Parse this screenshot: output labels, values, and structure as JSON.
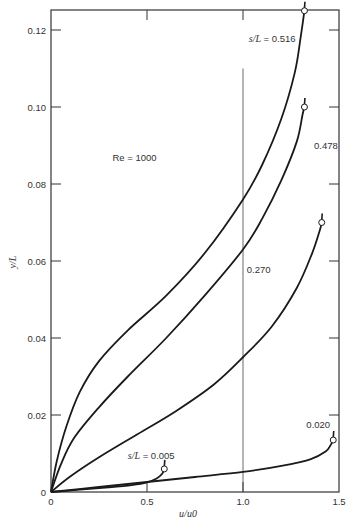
{
  "chart_data": {
    "type": "line",
    "title": "",
    "xlabel": "u/u0",
    "ylabel": "y/L",
    "xlim": [
      0,
      1.5
    ],
    "ylim": [
      0,
      0.125
    ],
    "grid": false,
    "x_ticks": [
      "0",
      "0.5",
      "1.0",
      "1.5"
    ],
    "y_ticks": [
      "0",
      "0.02",
      "0.04",
      "0.06",
      "0.08",
      "0.10",
      "0.12"
    ],
    "reference_line": {
      "x": 1.0,
      "y_from": 0,
      "y_to": 0.11
    },
    "annotations": [
      {
        "text": "Re = 1000",
        "x": 0.32,
        "y": 0.086
      },
      {
        "text": "s/L = 0.516",
        "x": 1.03,
        "y": 0.117
      },
      {
        "text": "0.478",
        "x": 1.37,
        "y": 0.089
      },
      {
        "text": "0.270",
        "x": 1.02,
        "y": 0.057
      },
      {
        "text": "0.020",
        "x": 1.33,
        "y": 0.0165
      },
      {
        "text": "s/L = 0.005",
        "x": 0.4,
        "y": 0.0085
      }
    ],
    "series": [
      {
        "name": "s/L = 0.516",
        "marker_end": true,
        "points": [
          [
            0,
            0
          ],
          [
            0.03,
            0.008
          ],
          [
            0.08,
            0.017
          ],
          [
            0.15,
            0.026
          ],
          [
            0.25,
            0.034
          ],
          [
            0.4,
            0.042
          ],
          [
            0.6,
            0.051
          ],
          [
            0.8,
            0.062
          ],
          [
            1.0,
            0.076
          ],
          [
            1.1,
            0.085
          ],
          [
            1.2,
            0.097
          ],
          [
            1.27,
            0.109
          ],
          [
            1.3,
            0.118
          ],
          [
            1.32,
            0.125
          ]
        ]
      },
      {
        "name": "s/L = 0.478",
        "marker_end": true,
        "points": [
          [
            0,
            0
          ],
          [
            0.05,
            0.007
          ],
          [
            0.12,
            0.014
          ],
          [
            0.25,
            0.022
          ],
          [
            0.4,
            0.03
          ],
          [
            0.6,
            0.04
          ],
          [
            0.8,
            0.051
          ],
          [
            1.0,
            0.063
          ],
          [
            1.1,
            0.071
          ],
          [
            1.2,
            0.081
          ],
          [
            1.28,
            0.091
          ],
          [
            1.31,
            0.098
          ],
          [
            1.32,
            0.1
          ]
        ]
      },
      {
        "name": "s/L = 0.270",
        "marker_end": true,
        "points": [
          [
            0,
            0
          ],
          [
            0.1,
            0.004
          ],
          [
            0.25,
            0.009
          ],
          [
            0.45,
            0.015
          ],
          [
            0.65,
            0.021
          ],
          [
            0.85,
            0.028
          ],
          [
            1.0,
            0.035
          ],
          [
            1.15,
            0.043
          ],
          [
            1.28,
            0.053
          ],
          [
            1.36,
            0.062
          ],
          [
            1.4,
            0.068
          ],
          [
            1.41,
            0.07
          ]
        ]
      },
      {
        "name": "s/L = 0.020",
        "marker_end": true,
        "points": [
          [
            0,
            0
          ],
          [
            0.25,
            0.0013
          ],
          [
            0.5,
            0.0026
          ],
          [
            0.75,
            0.0039
          ],
          [
            1.0,
            0.0052
          ],
          [
            1.2,
            0.0068
          ],
          [
            1.35,
            0.0085
          ],
          [
            1.43,
            0.0105
          ],
          [
            1.46,
            0.0125
          ],
          [
            1.47,
            0.0135
          ]
        ]
      },
      {
        "name": "s/L = 0.005",
        "marker_end": true,
        "points": [
          [
            0,
            0
          ],
          [
            0.15,
            0.0006
          ],
          [
            0.3,
            0.0012
          ],
          [
            0.42,
            0.0018
          ],
          [
            0.5,
            0.0025
          ],
          [
            0.55,
            0.0035
          ],
          [
            0.58,
            0.0048
          ],
          [
            0.59,
            0.006
          ]
        ]
      }
    ]
  },
  "labels": {
    "x_axis_title": "u/u0",
    "y_axis_title": "y/L",
    "re_label": "Re = 1000",
    "s516": "s/L = 0.516",
    "s478": "0.478",
    "s270": "0.270",
    "s020": "0.020",
    "s005": "s/L = 0.005"
  }
}
